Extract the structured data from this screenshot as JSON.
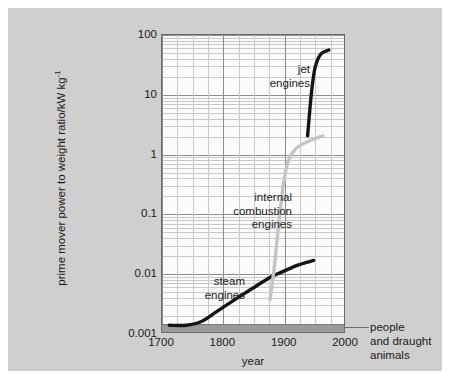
{
  "chart_data": {
    "type": "line",
    "title": "",
    "subtitle": "",
    "xlabel": "year",
    "ylabel": "prime mover power to weight ratio/kW kg",
    "ylabel_exponent": "-1",
    "xlim": [
      1700,
      2000
    ],
    "ylim": [
      0.001,
      100
    ],
    "yscale": "log",
    "xscale": "linear",
    "grid": true,
    "legend_position": "inline-annotations",
    "xticks": [
      "1700",
      "1800",
      "1900",
      "2000"
    ],
    "xtick_values": [
      1700,
      1800,
      1900,
      2000
    ],
    "yticks": [
      "100",
      "10",
      "1",
      "0.1",
      "0.01",
      "0.001"
    ],
    "ytick_values": [
      100,
      10,
      1,
      0.1,
      0.01,
      0.001
    ],
    "series": [
      {
        "name": "steam engines",
        "color": "#141414",
        "points": [
          {
            "x": 1712,
            "y": 0.0013
          },
          {
            "x": 1740,
            "y": 0.0013
          },
          {
            "x": 1765,
            "y": 0.0015
          },
          {
            "x": 1790,
            "y": 0.0022
          },
          {
            "x": 1820,
            "y": 0.0035
          },
          {
            "x": 1850,
            "y": 0.0055
          },
          {
            "x": 1880,
            "y": 0.0085
          },
          {
            "x": 1900,
            "y": 0.0105
          },
          {
            "x": 1925,
            "y": 0.0135
          },
          {
            "x": 1950,
            "y": 0.016
          }
        ]
      },
      {
        "name": "internal combustion engines",
        "color": "#c4c4c4",
        "points": [
          {
            "x": 1878,
            "y": 0.0035
          },
          {
            "x": 1885,
            "y": 0.012
          },
          {
            "x": 1892,
            "y": 0.06
          },
          {
            "x": 1900,
            "y": 0.3
          },
          {
            "x": 1908,
            "y": 0.75
          },
          {
            "x": 1920,
            "y": 1.2
          },
          {
            "x": 1940,
            "y": 1.6
          },
          {
            "x": 1965,
            "y": 2.0
          }
        ]
      },
      {
        "name": "jet engines",
        "color": "#141414",
        "points": [
          {
            "x": 1940,
            "y": 2.0
          },
          {
            "x": 1944,
            "y": 6.0
          },
          {
            "x": 1948,
            "y": 15.0
          },
          {
            "x": 1953,
            "y": 30.0
          },
          {
            "x": 1962,
            "y": 48.0
          },
          {
            "x": 1975,
            "y": 56.0
          }
        ]
      }
    ],
    "bands": [
      {
        "name": "people and draught animals",
        "label": "people\nand draught\nanimals",
        "color": "#9a9a9a",
        "y_low": 0.001,
        "y_high": 0.00145,
        "x_from": 1700,
        "x_to": 2000
      }
    ],
    "annotations": [
      {
        "name": "jet-engines-label",
        "text": "jet\nengines"
      },
      {
        "name": "internal-combustion-label",
        "text": "internal\ncombustion\nengines"
      },
      {
        "name": "steam-engines-label",
        "text": "steam\nengines"
      }
    ]
  },
  "figure": {
    "background_color": "#cfcfcf",
    "plot_background_color": "#fbfbfb",
    "frame_color": "#6a6a6a",
    "grid_major_color": "#8d8d8d",
    "grid_minor_color": "#c9c9c9",
    "outer_margin_color": "#ffffff"
  }
}
